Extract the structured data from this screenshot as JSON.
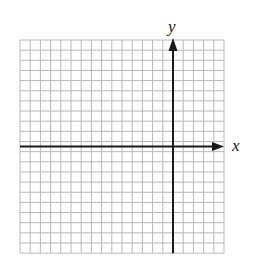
{
  "diagram": {
    "type": "coordinate-grid",
    "grid": {
      "columns": 20,
      "rows": 21,
      "left": 20,
      "top": 40,
      "cell_width": 10.2,
      "cell_height": 10.15,
      "line_color": "#b8b8b8"
    },
    "axes": {
      "color": "#1a1a1a",
      "y_axis_column": 15,
      "x_axis_row": 10.5,
      "x_label": "x",
      "y_label": "y"
    }
  }
}
